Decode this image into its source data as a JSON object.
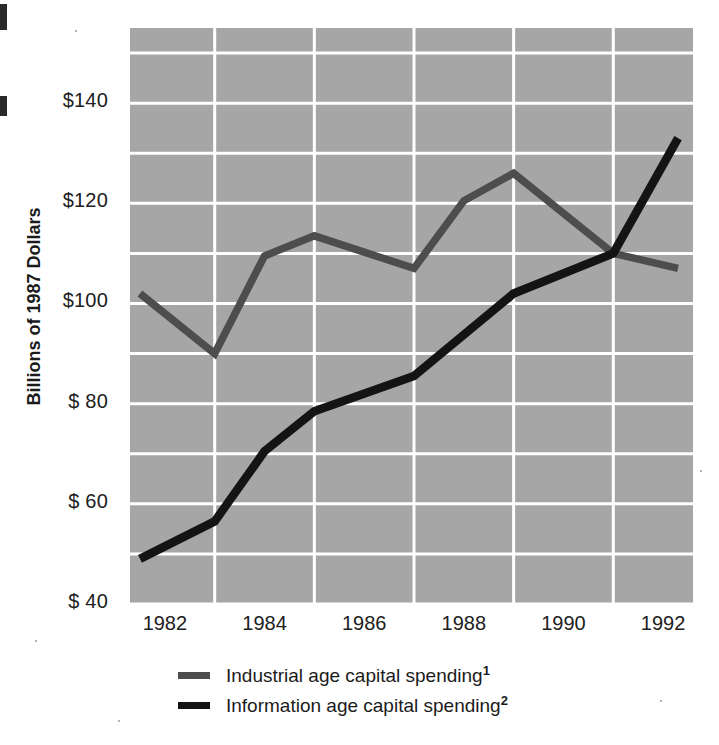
{
  "chart_data": {
    "type": "line",
    "title": "",
    "subtitle": "",
    "xlabel": "",
    "ylabel": "Billions of 1987 Dollars",
    "xlim": [
      1981.3,
      1992.6
    ],
    "ylim": [
      40,
      155
    ],
    "xticks": [
      1982,
      1984,
      1986,
      1988,
      1990,
      1992
    ],
    "xtick_labels": [
      "1982",
      "1984",
      "1986",
      "1988",
      "1990",
      "1992"
    ],
    "yticks": [
      40,
      60,
      80,
      100,
      120,
      140
    ],
    "ytick_labels": [
      "$ 40",
      "$ 60",
      "$ 80",
      "$100",
      "$120",
      "$140"
    ],
    "y_minor_step": 10,
    "x_minor_step": 1,
    "grid": true,
    "grid_color": "#ffffff",
    "plot_bg": "#a6a6a6",
    "legend_position": "below",
    "series": [
      {
        "name": "Industrial age capital spending",
        "footnote": "1",
        "color": "#4d4d4d",
        "x": [
          1981.5,
          1983,
          1984,
          1985,
          1987,
          1988,
          1989,
          1991,
          1992.3
        ],
        "values": [
          102,
          90,
          109.5,
          113.5,
          107,
          120.5,
          126,
          110,
          107
        ]
      },
      {
        "name": "Information age capital spending",
        "footnote": "2",
        "color": "#141414",
        "x": [
          1981.5,
          1983,
          1984,
          1985,
          1987,
          1989,
          1991,
          1992.3
        ],
        "values": [
          49,
          56.5,
          70.5,
          78.5,
          85.5,
          102,
          110,
          133
        ]
      }
    ]
  },
  "axis": {
    "y_title": "Billions of 1987 Dollars"
  },
  "legend": {
    "items": [
      {
        "label": "Industrial age capital spending",
        "footnote": "1",
        "color": "#4d4d4d"
      },
      {
        "label": "Information age capital spending",
        "footnote": "2",
        "color": "#141414"
      }
    ]
  }
}
